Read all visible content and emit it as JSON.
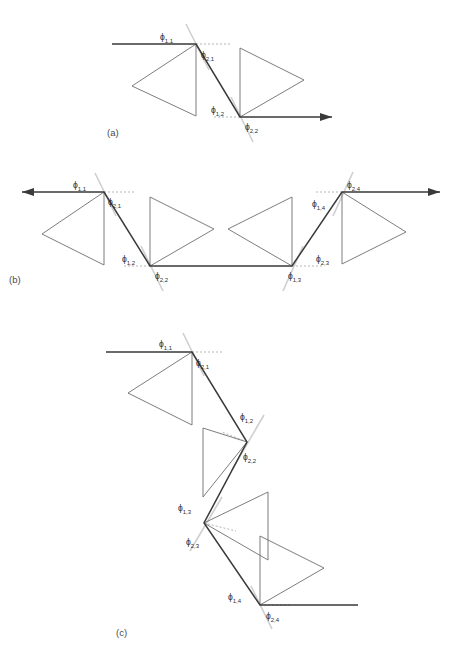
{
  "figure": {
    "width": 453,
    "height": 651,
    "background": "#ffffff",
    "colors": {
      "path_stroke": "#3a3a3a",
      "triangle_stroke": "#6e6e6e",
      "guide_stroke": "#cfcfcf",
      "dotted_stroke": "#b5b5b5",
      "text": "#2b2b2b",
      "caption": "#4a4a4a"
    }
  },
  "panels": [
    {
      "id": "a",
      "caption": "(a)",
      "caption_pos": {
        "x": 107,
        "y": 136
      },
      "arrow_start": false,
      "arrow_end": true,
      "path_points": [
        {
          "x": 112,
          "y": 44
        },
        {
          "x": 196,
          "y": 44
        },
        {
          "x": 240,
          "y": 117
        },
        {
          "x": 332,
          "y": 117
        }
      ],
      "vertices": [
        {
          "name": "v1",
          "x": 196,
          "y": 44,
          "labels": [
            {
              "text": "ϕ",
              "sub": "1,1",
              "x": 160,
              "y": 40
            },
            {
              "text": "ϕ",
              "sub": "2,1",
              "x": 201,
              "y": 58
            }
          ],
          "guide": {
            "x1": 186,
            "y1": 24,
            "x2": 209,
            "y2": 70
          },
          "dotted": {
            "x1": 196,
            "y1": 44,
            "x2": 232,
            "y2": 44
          },
          "triangle": [
            {
              "x": 196,
              "y": 44
            },
            {
              "x": 196,
              "y": 116
            },
            {
              "x": 132,
              "y": 86
            }
          ]
        },
        {
          "name": "v2",
          "x": 240,
          "y": 117,
          "labels": [
            {
              "text": "ϕ",
              "sub": "1,2",
              "x": 211,
              "y": 113
            },
            {
              "text": "ϕ",
              "sub": "2,2",
              "x": 245,
              "y": 130
            }
          ],
          "guide": {
            "x1": 231,
            "y1": 97,
            "x2": 253,
            "y2": 142
          },
          "dotted": {
            "x1": 214,
            "y1": 117,
            "x2": 240,
            "y2": 117
          },
          "triangle": [
            {
              "x": 240,
              "y": 117
            },
            {
              "x": 240,
              "y": 48
            },
            {
              "x": 304,
              "y": 80
            }
          ]
        }
      ]
    },
    {
      "id": "b",
      "caption": "(b)",
      "caption_pos": {
        "x": 9,
        "y": 283
      },
      "arrow_start": true,
      "arrow_end": true,
      "path_points": [
        {
          "x": 22,
          "y": 192
        },
        {
          "x": 104,
          "y": 192
        },
        {
          "x": 150,
          "y": 266
        },
        {
          "x": 292,
          "y": 266
        },
        {
          "x": 342,
          "y": 192
        },
        {
          "x": 440,
          "y": 192
        }
      ],
      "vertices": [
        {
          "name": "v1",
          "x": 104,
          "y": 192,
          "labels": [
            {
              "text": "ϕ",
              "sub": "1,1",
              "x": 73,
              "y": 188
            },
            {
              "text": "ϕ",
              "sub": "2,1",
              "x": 108,
              "y": 205
            }
          ],
          "guide": {
            "x1": 95,
            "y1": 173,
            "x2": 116,
            "y2": 216
          },
          "dotted": {
            "x1": 104,
            "y1": 192,
            "x2": 136,
            "y2": 192
          },
          "triangle": [
            {
              "x": 104,
              "y": 192
            },
            {
              "x": 104,
              "y": 265
            },
            {
              "x": 42,
              "y": 234
            }
          ]
        },
        {
          "name": "v2",
          "x": 150,
          "y": 266,
          "labels": [
            {
              "text": "ϕ",
              "sub": "1,2",
              "x": 122,
              "y": 262
            },
            {
              "text": "ϕ",
              "sub": "2,2",
              "x": 155,
              "y": 279
            }
          ],
          "guide": {
            "x1": 141,
            "y1": 246,
            "x2": 163,
            "y2": 291
          },
          "dotted": {
            "x1": 124,
            "y1": 266,
            "x2": 150,
            "y2": 266
          },
          "triangle": [
            {
              "x": 150,
              "y": 266
            },
            {
              "x": 150,
              "y": 197
            },
            {
              "x": 214,
              "y": 229
            }
          ]
        },
        {
          "name": "v3",
          "x": 292,
          "y": 266,
          "labels": [
            {
              "text": "ϕ",
              "sub": "1,3",
              "x": 288,
              "y": 279
            },
            {
              "text": "ϕ",
              "sub": "2,3",
              "x": 316,
              "y": 262
            }
          ],
          "guide": {
            "x1": 283,
            "y1": 291,
            "x2": 303,
            "y2": 246
          },
          "dotted": {
            "x1": 292,
            "y1": 266,
            "x2": 322,
            "y2": 266
          },
          "triangle": [
            {
              "x": 292,
              "y": 266
            },
            {
              "x": 292,
              "y": 197
            },
            {
              "x": 228,
              "y": 229
            }
          ]
        },
        {
          "name": "v4",
          "x": 342,
          "y": 192,
          "labels": [
            {
              "text": "ϕ",
              "sub": "1,4",
              "x": 312,
              "y": 207
            },
            {
              "text": "ϕ",
              "sub": "2,4",
              "x": 347,
              "y": 188
            }
          ],
          "guide": {
            "x1": 333,
            "y1": 216,
            "x2": 353,
            "y2": 172
          },
          "dotted": {
            "x1": 316,
            "y1": 192,
            "x2": 342,
            "y2": 192
          },
          "triangle": [
            {
              "x": 342,
              "y": 192
            },
            {
              "x": 342,
              "y": 264
            },
            {
              "x": 406,
              "y": 232
            }
          ]
        }
      ]
    },
    {
      "id": "c",
      "caption": "(c)",
      "caption_pos": {
        "x": 116,
        "y": 636
      },
      "arrow_start": false,
      "arrow_end": false,
      "path_points": [
        {
          "x": 106,
          "y": 352
        },
        {
          "x": 192,
          "y": 352
        },
        {
          "x": 247,
          "y": 442
        },
        {
          "x": 204,
          "y": 523
        },
        {
          "x": 260,
          "y": 605
        },
        {
          "x": 358,
          "y": 605
        }
      ],
      "vertices": [
        {
          "name": "v1",
          "x": 192,
          "y": 352,
          "labels": [
            {
              "text": "ϕ",
              "sub": "1,1",
              "x": 159,
              "y": 347
            },
            {
              "text": "ϕ",
              "sub": "2,1",
              "x": 196,
              "y": 366
            }
          ],
          "guide": {
            "x1": 183,
            "y1": 333,
            "x2": 204,
            "y2": 376
          },
          "dotted": {
            "x1": 192,
            "y1": 352,
            "x2": 224,
            "y2": 352
          },
          "triangle": [
            {
              "x": 192,
              "y": 352
            },
            {
              "x": 192,
              "y": 425
            },
            {
              "x": 128,
              "y": 393
            }
          ]
        },
        {
          "name": "v2",
          "x": 247,
          "y": 442,
          "labels": [
            {
              "text": "ϕ",
              "sub": "1,2",
              "x": 240,
              "y": 420
            },
            {
              "text": "ϕ",
              "sub": "2,2",
              "x": 243,
              "y": 460
            }
          ],
          "guide": {
            "x1": 264,
            "y1": 415,
            "x2": 232,
            "y2": 470
          },
          "dotted": {
            "x1": 247,
            "y1": 442,
            "x2": 222,
            "y2": 432
          },
          "triangle": [
            {
              "x": 247,
              "y": 442
            },
            {
              "x": 203,
              "y": 428
            },
            {
              "x": 203,
              "y": 497
            }
          ]
        },
        {
          "name": "v3",
          "x": 204,
          "y": 523,
          "labels": [
            {
              "text": "ϕ",
              "sub": "1,3",
              "x": 178,
              "y": 511
            },
            {
              "text": "ϕ",
              "sub": "2,3",
              "x": 186,
              "y": 545
            }
          ],
          "guide": {
            "x1": 222,
            "y1": 497,
            "x2": 190,
            "y2": 551
          },
          "dotted": {
            "x1": 204,
            "y1": 523,
            "x2": 236,
            "y2": 531
          },
          "triangle": [
            {
              "x": 204,
              "y": 523
            },
            {
              "x": 268,
              "y": 492
            },
            {
              "x": 268,
              "y": 560
            }
          ]
        },
        {
          "name": "v4",
          "x": 260,
          "y": 605,
          "labels": [
            {
              "text": "ϕ",
              "sub": "1,4",
              "x": 228,
              "y": 600
            },
            {
              "text": "ϕ",
              "sub": "2,4",
              "x": 266,
              "y": 619
            }
          ],
          "guide": {
            "x1": 251,
            "y1": 586,
            "x2": 272,
            "y2": 629
          },
          "dotted": {
            "x1": 260,
            "y1": 605,
            "x2": 292,
            "y2": 605
          },
          "triangle": [
            {
              "x": 260,
              "y": 605
            },
            {
              "x": 260,
              "y": 536
            },
            {
              "x": 324,
              "y": 568
            }
          ]
        }
      ]
    }
  ]
}
